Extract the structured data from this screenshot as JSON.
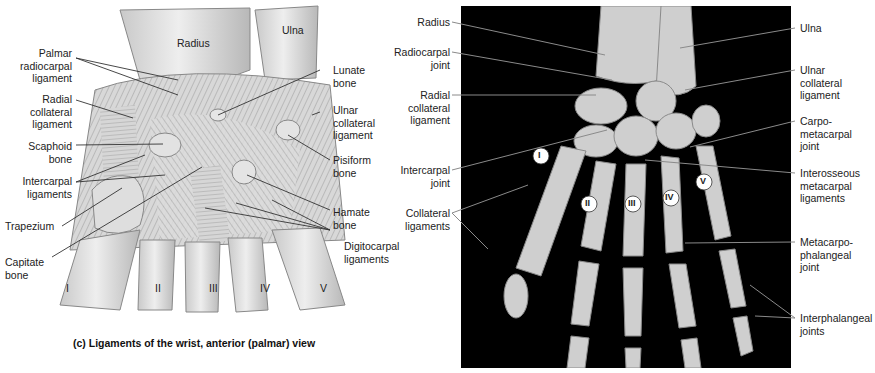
{
  "figure_c": {
    "caption": "(c) Ligaments of the wrist, anterior (palmar) view",
    "bone_labels": {
      "radius": "Radius",
      "ulna": "Ulna"
    },
    "metacarpal_numerals": [
      "I",
      "II",
      "III",
      "IV",
      "V"
    ],
    "labels_left": [
      {
        "id": "palmar-radiocarpal-ligament",
        "text": "Palmar\nradiocarpal\nligament"
      },
      {
        "id": "radial-collateral-ligament",
        "text": "Radial\ncollateral\nligament"
      },
      {
        "id": "scaphoid-bone",
        "text": "Scaphoid\nbone"
      },
      {
        "id": "intercarpal-ligaments",
        "text": "Intercarpal\nligaments"
      },
      {
        "id": "trapezium",
        "text": "Trapezium"
      },
      {
        "id": "capitate-bone",
        "text": "Capitate\nbone"
      }
    ],
    "labels_right": [
      {
        "id": "lunate-bone",
        "text": "Lunate\nbone"
      },
      {
        "id": "ulnar-collateral-ligament",
        "text": "Ulnar\ncollateral\nligament"
      },
      {
        "id": "pisiform-bone",
        "text": "Pisiform\nbone"
      },
      {
        "id": "hamate-bone",
        "text": "Hamate\nbone"
      },
      {
        "id": "digitocarpal-ligaments",
        "text": "Digitocarpal\nligaments"
      }
    ]
  },
  "figure_xray": {
    "metacarpal_numerals": [
      "I",
      "II",
      "III",
      "IV",
      "V"
    ],
    "labels_left": [
      {
        "id": "radius",
        "text": "Radius"
      },
      {
        "id": "radiocarpal-joint",
        "text": "Radiocarpal\njoint"
      },
      {
        "id": "radial-collateral-ligament",
        "text": "Radial\ncollateral\nligament"
      },
      {
        "id": "intercarpal-joint",
        "text": "Intercarpal\njoint"
      },
      {
        "id": "collateral-ligaments",
        "text": "Collateral\nligaments"
      }
    ],
    "labels_right": [
      {
        "id": "ulna",
        "text": "Ulna"
      },
      {
        "id": "ulnar-collateral-ligament",
        "text": "Ulnar\ncollateral\nligament"
      },
      {
        "id": "carpometacarpal-joint",
        "text": "Carpo-\nmetacarpal\njoint"
      },
      {
        "id": "interosseous-metacarpal-ligaments",
        "text": "Interosseous\nmetacarpal\nligaments"
      },
      {
        "id": "metacarpophalangeal-joint",
        "text": "Metacarpo-\nphalangeal\njoint"
      },
      {
        "id": "interphalangeal-joints",
        "text": "Interphalangeal\njoints"
      }
    ]
  }
}
